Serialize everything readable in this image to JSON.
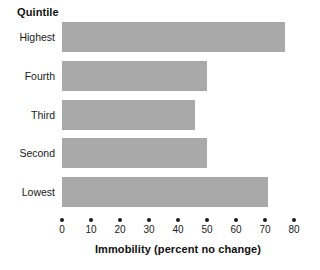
{
  "chart_data": {
    "type": "bar",
    "orientation": "horizontal",
    "title": "",
    "xlabel": "Immobility (percent no change)",
    "ylabel": "Quintile",
    "categories": [
      "Highest",
      "Fourth",
      "Third",
      "Second",
      "Lowest"
    ],
    "values": [
      77,
      50,
      46,
      50,
      71
    ],
    "xlim": [
      0,
      80
    ],
    "xticks": [
      0,
      10,
      20,
      30,
      40,
      50,
      60,
      70,
      80
    ],
    "xtick_labels": [
      "0",
      "10",
      "20",
      "30",
      "40",
      "50",
      "60",
      "70",
      "80"
    ],
    "grid": false,
    "legend": false,
    "bar_color": "#a9a9a9",
    "text_color": "#1a1a1a",
    "background_color": "#ffffff"
  },
  "bars": [
    {
      "label": "Highest",
      "value": 77
    },
    {
      "label": "Fourth",
      "value": 50
    },
    {
      "label": "Third",
      "value": 46
    },
    {
      "label": "Second",
      "value": 50
    },
    {
      "label": "Lowest",
      "value": 71
    }
  ]
}
